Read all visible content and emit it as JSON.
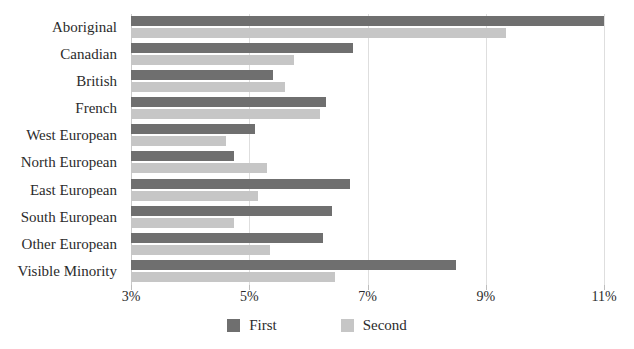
{
  "chart_data": {
    "type": "bar",
    "orientation": "horizontal",
    "title": "",
    "xlabel": "",
    "ylabel": "",
    "xlim": [
      3,
      11
    ],
    "xticks": [
      3,
      5,
      7,
      9,
      11
    ],
    "xtick_labels": [
      "3%",
      "5%",
      "7%",
      "9%",
      "11%"
    ],
    "grid": true,
    "legend_position": "bottom-center",
    "categories": [
      "Aboriginal",
      "Canadian",
      "British",
      "French",
      "West European",
      "North European",
      "East European",
      "South European",
      "Other European",
      "Visible Minority"
    ],
    "series": [
      {
        "name": "First",
        "color": "#6f6f6f",
        "values": [
          11.0,
          6.75,
          5.4,
          6.3,
          5.1,
          4.75,
          6.7,
          6.4,
          6.25,
          8.5
        ]
      },
      {
        "name": "Second",
        "color": "#c6c6c6",
        "values": [
          9.35,
          5.75,
          5.6,
          6.2,
          4.6,
          5.3,
          5.15,
          4.75,
          5.35,
          6.45
        ]
      }
    ]
  },
  "title_sliver": "",
  "legend": {
    "items": [
      {
        "label": "First",
        "color": "#6f6f6f"
      },
      {
        "label": "Second",
        "color": "#c6c6c6"
      }
    ]
  },
  "colors": {
    "first": "#6f6f6f",
    "second": "#c6c6c6",
    "gridline": "#dedede",
    "axis": "#c9c9c9",
    "text": "#2b2b2b",
    "background": "#ffffff"
  }
}
